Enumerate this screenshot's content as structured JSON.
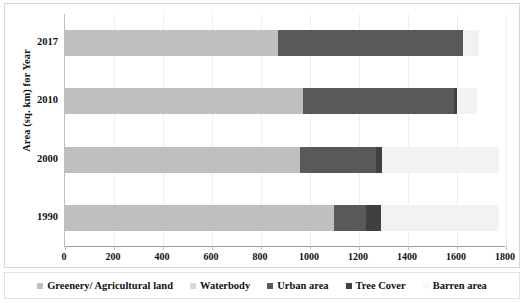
{
  "chart_data": {
    "type": "bar",
    "orientation": "horizontal",
    "stacked": true,
    "title": "",
    "xlabel": "",
    "ylabel": "Area (sq. km) for Year",
    "categories": [
      "2017",
      "2010",
      "2000",
      "1990"
    ],
    "xlim": [
      0,
      1800
    ],
    "xticks": [
      0,
      200,
      400,
      600,
      800,
      1000,
      1200,
      1400,
      1600,
      1800
    ],
    "grid": true,
    "legend_position": "bottom",
    "series": [
      {
        "name": "Greenery/ Agricultural land",
        "color": "#bfbfbf",
        "values": [
          869,
          971,
          959,
          1098
        ]
      },
      {
        "name": "Waterbody",
        "color": "#d9d9d9",
        "values": [
          0,
          0,
          0,
          0
        ]
      },
      {
        "name": "Urban area",
        "color": "#595959",
        "values": [
          756,
          617,
          310,
          132
        ]
      },
      {
        "name": "Tree Cover",
        "color": "#404040",
        "values": [
          0,
          12,
          25,
          61
        ]
      },
      {
        "name": "Barren area",
        "color": "#f2f2f2",
        "values": [
          65,
          82,
          477,
          481
        ]
      }
    ],
    "totals": [
      1690,
      1682,
      1771,
      1772
    ]
  },
  "axis": {
    "y_title": "Area (sq. km) for Year",
    "x_tick_labels": [
      "0",
      "200",
      "400",
      "600",
      "800",
      "1000",
      "1200",
      "1400",
      "1600",
      "1800"
    ],
    "category_labels": [
      "2017",
      "2010",
      "2000",
      "1990"
    ]
  },
  "legend": {
    "items": [
      {
        "label": "Greenery/ Agricultural land",
        "color": "#bfbfbf"
      },
      {
        "label": "Waterbody",
        "color": "#d9d9d9"
      },
      {
        "label": "Urban area",
        "color": "#595959"
      },
      {
        "label": "Tree Cover",
        "color": "#404040"
      },
      {
        "label": "Barren area",
        "color": "#f7f7f7"
      }
    ]
  }
}
